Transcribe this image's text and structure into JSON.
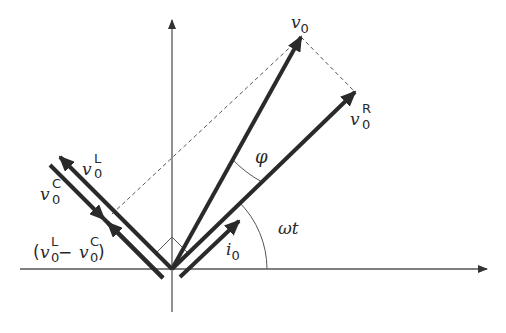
{
  "diagram": {
    "type": "phasor-diagram",
    "colors": {
      "ink": "#2a2a2a",
      "axis": "#555555",
      "dashed": "#555555",
      "background": "#ffffff"
    },
    "labels": {
      "v0": {
        "base": "v",
        "sub": "0",
        "sup": ""
      },
      "v0R": {
        "base": "v",
        "sub": "0",
        "sup": "R"
      },
      "v0L": {
        "base": "v",
        "sub": "0",
        "sup": "L"
      },
      "v0C": {
        "base": "v",
        "sub": "0",
        "sup": "C"
      },
      "diff": {
        "open": "(",
        "base1": "v",
        "sub1": "0",
        "sup1": "L",
        "minus": " − ",
        "base2": "v",
        "sub2": "0",
        "sup2": "C",
        "close": ")"
      },
      "i0": {
        "base": "i",
        "sub": "0"
      },
      "phi": "φ",
      "omega_t": "ωt"
    },
    "phasors": [
      {
        "name": "v0",
        "from": [
          172,
          269
        ],
        "to": [
          301,
          37
        ]
      },
      {
        "name": "v0R",
        "from": [
          172,
          269
        ],
        "to": [
          355,
          92
        ]
      },
      {
        "name": "v0L",
        "from": [
          172,
          269
        ],
        "to": [
          60,
          157
        ]
      },
      {
        "name": "v0C",
        "from": [
          52,
          167
        ],
        "to": [
          160,
          275
        ]
      },
      {
        "name": "v0L-v0C",
        "from": [
          172,
          269
        ],
        "to": [
          110,
          207
        ]
      },
      {
        "name": "i0",
        "from": [
          180,
          277
        ],
        "to": [
          240,
          217
        ]
      }
    ],
    "angles": {
      "omega_t_label": "ωt",
      "phi_label": "φ"
    }
  }
}
